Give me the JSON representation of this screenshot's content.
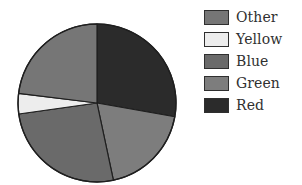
{
  "chart_data": {
    "type": "pie",
    "title": "",
    "subtitle": "",
    "xlabel": "",
    "ylabel": "",
    "grid": false,
    "legend_position": "right",
    "start_angle_deg": 0,
    "direction": "clockwise",
    "labels": [
      "Red",
      "Green",
      "Blue",
      "Yellow",
      "Other"
    ],
    "values": [
      27.8,
      18.9,
      26.1,
      4.2,
      23.0
    ],
    "units": "percent",
    "slices": [
      {
        "name": "Red",
        "value": 27.8,
        "start_angle_deg": 0,
        "end_angle_deg": 100,
        "color": "#2b2b2b"
      },
      {
        "name": "Green",
        "value": 18.9,
        "start_angle_deg": 100,
        "end_angle_deg": 168,
        "color": "#7d7d7d"
      },
      {
        "name": "Blue",
        "value": 26.1,
        "start_angle_deg": 168,
        "end_angle_deg": 262,
        "color": "#6a6a6a"
      },
      {
        "name": "Yellow",
        "value": 4.2,
        "start_angle_deg": 262,
        "end_angle_deg": 277,
        "color": "#ededed"
      },
      {
        "name": "Other",
        "value": 23.0,
        "start_angle_deg": 277,
        "end_angle_deg": 360,
        "color": "#767676"
      }
    ],
    "geometry": {
      "center_x": 97,
      "center_y": 103,
      "radius": 79
    },
    "outline_color": "#1f1f1f"
  },
  "legend": {
    "items": [
      {
        "label": "Other",
        "color": "#767676"
      },
      {
        "label": "Yellow",
        "color": "#ededed"
      },
      {
        "label": "Blue",
        "color": "#6a6a6a"
      },
      {
        "label": "Green",
        "color": "#7d7d7d"
      },
      {
        "label": "Red",
        "color": "#2b2b2b"
      }
    ]
  }
}
